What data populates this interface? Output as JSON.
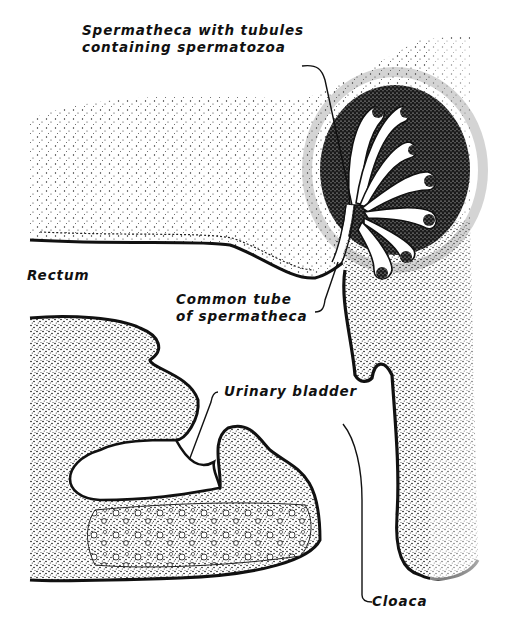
{
  "figure": {
    "type": "anatomical-illustration",
    "style": "black-and-white stippled section drawing",
    "colors": {
      "ink": "#111111",
      "paper": "#ffffff"
    },
    "structures": [
      "spermatheca-tubules",
      "common-tube",
      "rectum",
      "urinary-bladder",
      "cloaca"
    ]
  },
  "labels": {
    "spermatheca": {
      "line1": "Spermatheca with tubules",
      "line2": "containing spermatozoa"
    },
    "rectum": "Rectum",
    "common_tube": {
      "line1": "Common tube",
      "line2": "of spermatheca"
    },
    "urinary_bladder": "Urinary bladder",
    "cloaca": "Cloaca"
  }
}
